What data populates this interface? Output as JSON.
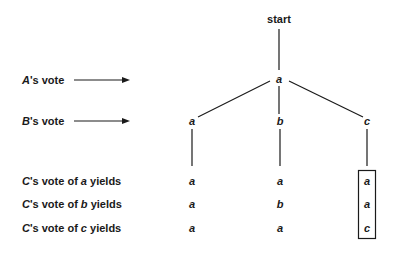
{
  "diagram": {
    "type": "game-tree",
    "root": "start",
    "row_labels": {
      "a_vote": {
        "voter": "A",
        "suffix": "'s vote"
      },
      "b_vote": {
        "voter": "B",
        "suffix": "'s vote"
      },
      "c_vote_a": {
        "voter": "C",
        "mid": "'s vote of ",
        "choice": "a",
        "end": " yields"
      },
      "c_vote_b": {
        "voter": "C",
        "mid": "'s vote of ",
        "choice": "b",
        "end": " yields"
      },
      "c_vote_c": {
        "voter": "C",
        "mid": "'s vote of ",
        "choice": "c",
        "end": " yields"
      }
    },
    "a_node": "a",
    "b_nodes": [
      "a",
      "b",
      "c"
    ],
    "outcomes": [
      [
        "a",
        "a",
        "a"
      ],
      [
        "a",
        "b",
        "a"
      ],
      [
        "a",
        "a",
        "c"
      ]
    ],
    "highlighted_column": 2
  }
}
